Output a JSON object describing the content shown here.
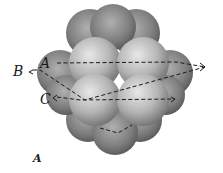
{
  "figure": {
    "caption": "A",
    "labels": {
      "a": "A",
      "b": "B",
      "c": "C"
    },
    "colors": {
      "background": "#ffffff",
      "sphere_light": "#d9d9d9",
      "sphere_mid": "#9a9a9a",
      "sphere_dark": "#5a5a5a",
      "dash_line": "#1a1a1a"
    }
  }
}
